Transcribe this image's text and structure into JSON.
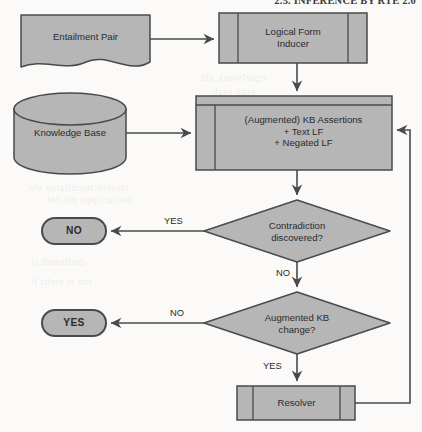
{
  "page": {
    "running_header": "2.5. INFERENCE BY RTE 2.0",
    "background_color": "#fbfaf8"
  },
  "style": {
    "shape_fill": "#b6b6b6",
    "shape_stroke": "#4a4a4a",
    "text_color": "#2b2b2b",
    "connector_color": "#4a4a4a"
  },
  "flowchart": {
    "type": "flowchart",
    "nodes": [
      {
        "id": "entailment-pair",
        "label": "Entailment Pair",
        "shape": "document"
      },
      {
        "id": "logical-form-inducer",
        "label": "Logical Form\nInducer",
        "shape": "predefined-process"
      },
      {
        "id": "knowledge-base",
        "label": "Knowledge Base",
        "shape": "cylinder"
      },
      {
        "id": "kb-assertions",
        "label": "(Augmented) KB Assertions\n+ Text LF\n+ Negated LF",
        "shape": "process-banded"
      },
      {
        "id": "contradiction-decision",
        "label": "Contradiction\ndiscovered?",
        "shape": "decision"
      },
      {
        "id": "terminal-no",
        "label": "NO",
        "shape": "terminator"
      },
      {
        "id": "augmented-kb-decision",
        "label": "Augmented KB\nchange?",
        "shape": "decision"
      },
      {
        "id": "terminal-yes",
        "label": "YES",
        "shape": "terminator"
      },
      {
        "id": "resolver",
        "label": "Resolver",
        "shape": "predefined-process"
      }
    ],
    "edges": [
      {
        "id": "edge-pair-to-inducer",
        "from": "entailment-pair",
        "to": "logical-form-inducer",
        "label": ""
      },
      {
        "id": "edge-inducer-to-assertions",
        "from": "logical-form-inducer",
        "to": "kb-assertions",
        "label": ""
      },
      {
        "id": "edge-kb-to-assertions",
        "from": "knowledge-base",
        "to": "kb-assertions",
        "label": ""
      },
      {
        "id": "edge-assertions-to-contradiction",
        "from": "kb-assertions",
        "to": "contradiction-decision",
        "label": ""
      },
      {
        "id": "edge-contradiction-yes",
        "from": "contradiction-decision",
        "to": "terminal-no",
        "label": "YES"
      },
      {
        "id": "edge-contradiction-no",
        "from": "contradiction-decision",
        "to": "augmented-kb-decision",
        "label": "NO"
      },
      {
        "id": "edge-augmented-no",
        "from": "augmented-kb-decision",
        "to": "terminal-yes",
        "label": "NO"
      },
      {
        "id": "edge-augmented-yes",
        "from": "augmented-kb-decision",
        "to": "resolver",
        "label": "YES"
      },
      {
        "id": "edge-resolver-feedback",
        "from": "resolver",
        "to": "kb-assertions",
        "label": ""
      }
    ]
  }
}
